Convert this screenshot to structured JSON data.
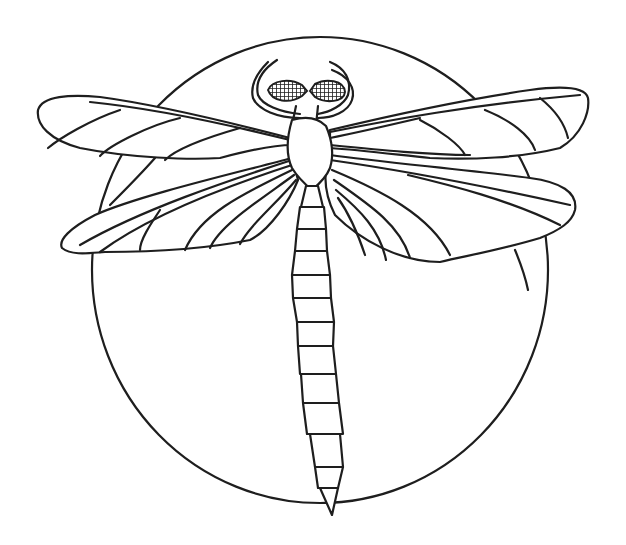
{
  "image": {
    "title": "Dragonfly coloring page",
    "subject": "dragonfly",
    "style": "black line drawing on white background",
    "background_shape": "circle",
    "colors": {
      "line": "#1e1e1e",
      "background": "#ffffff"
    }
  },
  "parts": {
    "circle": "background-circle",
    "head": "head-with-compound-eyes",
    "antennae": "curved-antennae",
    "thorax": "thorax",
    "upper_left_wing": "upper-left-wing",
    "lower_left_wing": "lower-left-wing",
    "upper_right_wing": "upper-right-wing",
    "lower_right_wing": "lower-right-wing",
    "abdomen": "segmented-abdomen",
    "abdomen_segments": 12
  }
}
